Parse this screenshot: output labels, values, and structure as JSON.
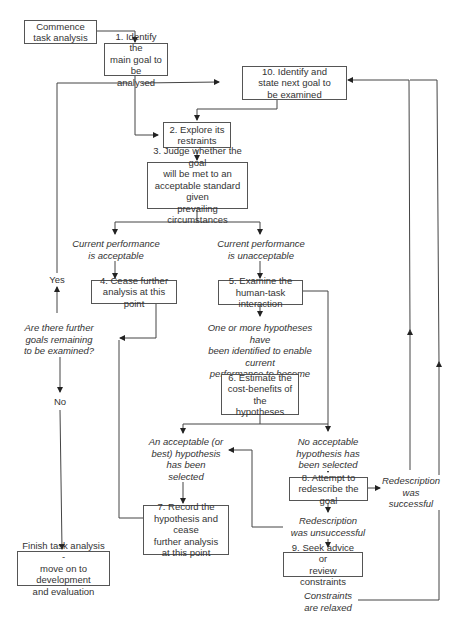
{
  "diagram": {
    "type": "flowchart",
    "nodes": {
      "start": "Commence\ntask analysis",
      "n1": "1. Identify the\nmain goal to be\nanalysed",
      "n2": "2. Explore its\nrestraints",
      "n3": "3. Judge whether the goal\nwill be met to an\nacceptable standard given\nprevailing circumstances",
      "n4": "4. Cease further\nanalysis at this point",
      "n5": "5. Examine the\nhuman-task interaction",
      "n6": "6. Estimate the\ncost-benefits of the\nhypotheses",
      "n7": "7. Record the\nhypothesis and cease\nfurther analysis\nat this point",
      "n8": "8. Attempt to\nredescribe the goal",
      "n9": "9. Seek advice or\nreview constraints",
      "n10": "10. Identify and\nstate next goal to\nbe examined",
      "finish": "Finish task analysis -\nmove on to development\nand evaluation"
    },
    "labels": {
      "acceptable": "Current performance\nis acceptable",
      "unacceptable": "Current performance\nis unacceptable",
      "hypotheses_identified": "One or more hypotheses have\nbeen identified to enable current\nperformance to become\nacceptable",
      "hypothesis_selected": "An acceptable (or\nbest) hypothesis\nhas been selected",
      "no_hypothesis": "No acceptable\nhypothesis has\nbeen selected",
      "redesc_success": "Redescription\nwas\nsuccessful",
      "redesc_fail": "Redescription\nwas unsuccessful",
      "constraints_relaxed": "Constraints\nare relaxed",
      "further_goals": "Are there further\ngoals remaining\nto be examined?",
      "yes": "Yes",
      "no": "No"
    },
    "colors": {
      "line": "#444444",
      "box_border": "#555555",
      "text": "#333333"
    }
  }
}
